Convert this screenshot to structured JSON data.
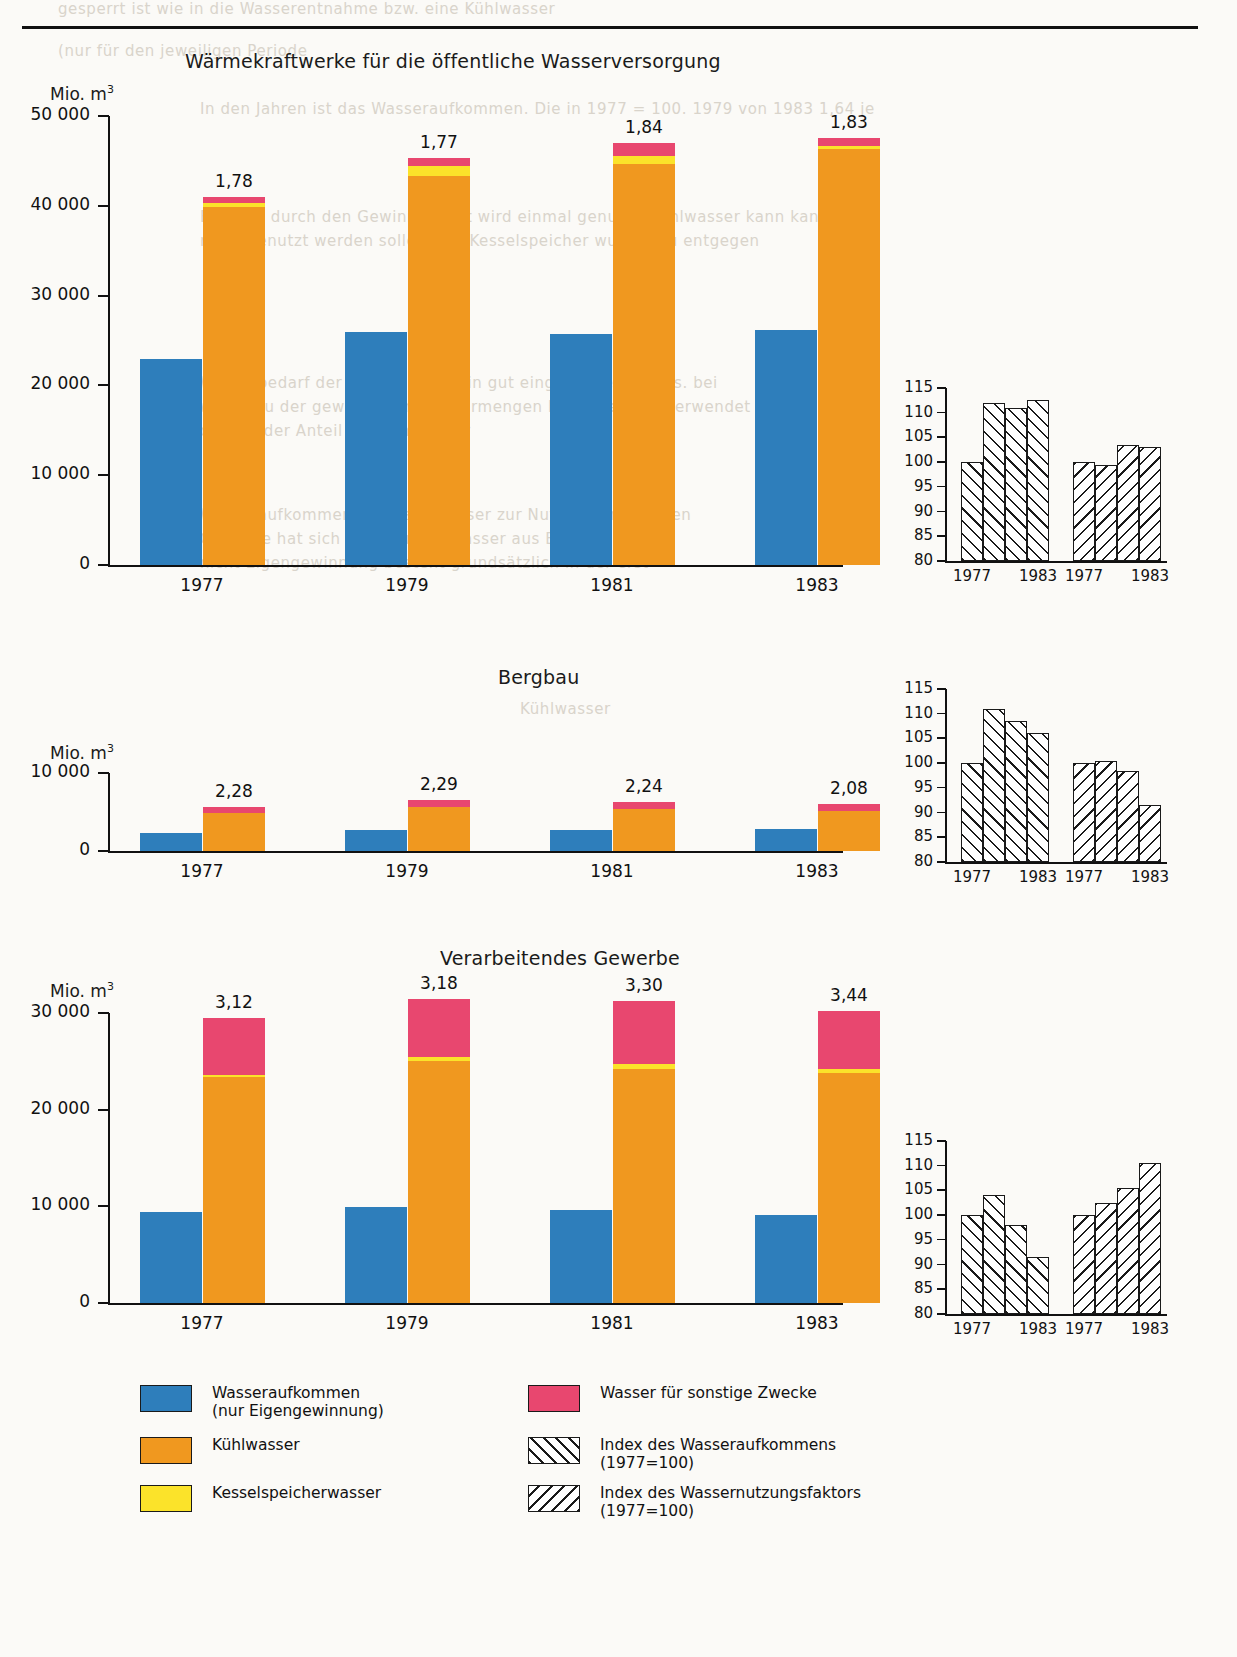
{
  "chart_data": [
    {
      "type": "bar",
      "title": "Wärmekraftwerke für die öffentliche Wasserversorgung",
      "ylabel": "Mio. m",
      "ylabel_sup": "3",
      "categories": [
        "1977",
        "1979",
        "1981",
        "1983"
      ],
      "yticks": [
        "0",
        "10 000",
        "20 000",
        "30 000",
        "40 000",
        "50 000"
      ],
      "ytick_values": [
        0,
        10000,
        20000,
        30000,
        40000,
        50000
      ],
      "ylim": [
        0,
        50000
      ],
      "grid": false,
      "series": [
        {
          "name": "Wasseraufkommen (nur Eigengewinnung)",
          "color": "#2e7ebb",
          "values": [
            22900,
            25900,
            25700,
            26200
          ]
        },
        {
          "name": "Kühlwasser",
          "color": "#f0981f",
          "values": [
            39900,
            43300,
            44700,
            46300
          ]
        },
        {
          "name": "Kesselspeicherwasser",
          "color": "#fbe32a",
          "values": [
            400,
            1100,
            900,
            400
          ]
        },
        {
          "name": "Wasser für sonstige Zwecke",
          "color": "#e8476f",
          "values": [
            700,
            900,
            1400,
            900
          ]
        }
      ],
      "data_labels": [
        "1,78",
        "1,77",
        "1,84",
        "1,83"
      ],
      "index_chart": {
        "yticks": [
          "80",
          "85",
          "90",
          "95",
          "100",
          "105",
          "110",
          "115"
        ],
        "ylim": [
          80,
          115
        ],
        "xlabels": [
          "1977",
          "1983",
          "1977",
          "1983"
        ],
        "groups": [
          {
            "name": "Index des Wasseraufkommens (1977=100)",
            "hatch": "a",
            "values": [
              100,
              112,
              111,
              112.5
            ]
          },
          {
            "name": "Index des Wassernutzungsfaktors (1977=100)",
            "hatch": "b",
            "values": [
              100,
              99.5,
              103.5,
              103
            ]
          }
        ]
      }
    },
    {
      "type": "bar",
      "title": "Bergbau",
      "ylabel": "Mio. m",
      "ylabel_sup": "3",
      "categories": [
        "1977",
        "1979",
        "1981",
        "1983"
      ],
      "yticks": [
        "0",
        "10 000"
      ],
      "ytick_values": [
        0,
        10000
      ],
      "ylim": [
        0,
        10000
      ],
      "grid": false,
      "series": [
        {
          "name": "Wasseraufkommen (nur Eigengewinnung)",
          "color": "#2e7ebb",
          "values": [
            2300,
            2750,
            2700,
            2800
          ]
        },
        {
          "name": "Kühlwasser",
          "color": "#f0981f",
          "values": [
            4900,
            5600,
            5400,
            5100
          ]
        },
        {
          "name": "Kesselspeicherwasser",
          "color": "#fbe32a",
          "values": [
            0,
            0,
            0,
            0
          ]
        },
        {
          "name": "Wasser für sonstige Zwecke",
          "color": "#e8476f",
          "values": [
            800,
            900,
            900,
            900
          ]
        }
      ],
      "data_labels": [
        "2,28",
        "2,29",
        "2,24",
        "2,08"
      ],
      "index_chart": {
        "yticks": [
          "80",
          "85",
          "90",
          "95",
          "100",
          "105",
          "110",
          "115"
        ],
        "ylim": [
          80,
          115
        ],
        "xlabels": [
          "1977",
          "1983",
          "1977",
          "1983"
        ],
        "groups": [
          {
            "name": "Index des Wasseraufkommens (1977=100)",
            "hatch": "a",
            "values": [
              100,
              111,
              108.5,
              106
            ]
          },
          {
            "name": "Index des Wassernutzungsfaktors (1977=100)",
            "hatch": "b",
            "values": [
              100,
              100.5,
              98.5,
              91.5
            ]
          }
        ]
      }
    },
    {
      "type": "bar",
      "title": "Verarbeitendes Gewerbe",
      "ylabel": "Mio. m",
      "ylabel_sup": "3",
      "categories": [
        "1977",
        "1979",
        "1981",
        "1983"
      ],
      "yticks": [
        "0",
        "10 000",
        "20 000",
        "30 000"
      ],
      "ytick_values": [
        0,
        10000,
        20000,
        30000
      ],
      "ylim": [
        0,
        30000
      ],
      "grid": false,
      "series": [
        {
          "name": "Wasseraufkommen (nur Eigengewinnung)",
          "color": "#2e7ebb",
          "values": [
            9400,
            9900,
            9600,
            9100
          ]
        },
        {
          "name": "Kühlwasser",
          "color": "#f0981f",
          "values": [
            23400,
            25000,
            24200,
            23800
          ]
        },
        {
          "name": "Kesselspeicherwasser",
          "color": "#fbe32a",
          "values": [
            200,
            400,
            500,
            400
          ]
        },
        {
          "name": "Wasser für sonstige Zwecke",
          "color": "#e8476f",
          "values": [
            5900,
            6100,
            6500,
            6000
          ]
        }
      ],
      "data_labels": [
        "3,12",
        "3,18",
        "3,30",
        "3,44"
      ],
      "index_chart": {
        "yticks": [
          "80",
          "85",
          "90",
          "95",
          "100",
          "105",
          "110",
          "115"
        ],
        "ylim": [
          80,
          115
        ],
        "xlabels": [
          "1977",
          "1983",
          "1977",
          "1983"
        ],
        "groups": [
          {
            "name": "Index des Wasseraufkommens (1977=100)",
            "hatch": "a",
            "values": [
              100,
              104,
              98,
              91.5
            ]
          },
          {
            "name": "Index des Wassernutzungsfaktors (1977=100)",
            "hatch": "b",
            "values": [
              100,
              102.5,
              105.5,
              110.5
            ]
          }
        ]
      }
    }
  ],
  "legend": {
    "items": [
      {
        "swatch": "blue",
        "color": "#2e7ebb",
        "line1": "Wasseraufkommen",
        "line2": "(nur Eigengewinnung)"
      },
      {
        "swatch": "orange",
        "color": "#f0981f",
        "line1": "Kühlwasser",
        "line2": ""
      },
      {
        "swatch": "yellow",
        "color": "#fbe32a",
        "line1": "Kesselspeicherwasser",
        "line2": ""
      },
      {
        "swatch": "pink",
        "color": "#e8476f",
        "line1": "Wasser für sonstige Zwecke",
        "line2": ""
      },
      {
        "swatch": "hatch-a",
        "color": "#ffffff",
        "line1": "Index des Wasseraufkommens",
        "line2": "(1977=100)"
      },
      {
        "swatch": "hatch-b",
        "color": "#ffffff",
        "line1": "Index des Wassernutzungsfaktors",
        "line2": "(1977=100)"
      }
    ]
  },
  "ghost_text": {
    "l1": "gesperrt ist wie in die Wasserentnahme bzw. eine Kühlwasser",
    "l2": "(nur für den jeweiligen Periode",
    "l3": "In den Jahren ist das Wasseraufkommen. Die in 1977 = 100. 1979 von 1983 1,64 je",
    "l4": "Erst das durch den Gewinnung ist wird einmal genutzt. Kühlwasser kann kann in",
    "l5": "mehr benutzt werden sollen. Die Kesselspeicher wurden zu entgegen",
    "l6": "Wasserbedarf der Wirtschaft der in gut eingeführten hinaus. bei",
    "l7": "weiter zu der gewonnenen Wassermengen bzw. Energien verwendet",
    "l8": "das die der Anteil der Kühlwasser",
    "l9": "Wasseraufkommen die reale Wasser zur Nutzung entstanden",
    "l10": "Gewerbe hat sich gleich unter Wasser aus Bergbau",
    "l11": "nicht Eigengewinnung besteht grundsätzlich in der erst",
    "l12": "Kühlwasser"
  }
}
